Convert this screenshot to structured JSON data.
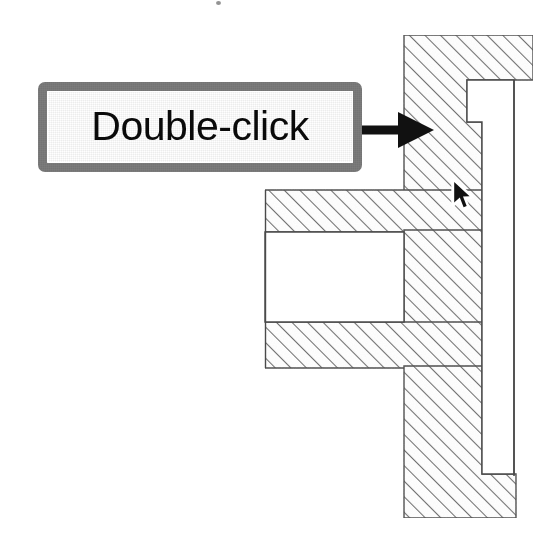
{
  "page": {
    "kind": "instructional-diagram",
    "background_color": "#ffffff",
    "width": 553,
    "height": 556
  },
  "callout": {
    "label": "Double-click",
    "border_color": "#7c7c7c",
    "fill_color": "#ffffff",
    "text_color": "#0a0a0a",
    "x": 38,
    "y": 82,
    "width": 324,
    "height": 90
  },
  "pointer_arrow": {
    "name": "arrow-pointing-right",
    "color": "#111111",
    "from_x": 352,
    "from_y": 130,
    "to_x": 432,
    "to_y": 130
  },
  "cursor": {
    "name": "mouse-pointer",
    "fill_color": "#111111",
    "outline_color": "#ffffff",
    "tip_x": 454,
    "tip_y": 182
  },
  "drawing": {
    "name": "hatched-cross-section-part",
    "outline_color": "#4a4a4a",
    "hatch_color": "#6a6a6a",
    "hatch_angle_degrees": 45,
    "hatch_spacing": 11,
    "fill_color": "#ffffff",
    "regions": [
      {
        "name": "upper-flange-column",
        "points": "404,35 533,35 533,80 467,80 467,122 482,122 482,192 404,192"
      },
      {
        "name": "upper-web-bar",
        "points": "265,190 482,190 482,232 265,232"
      },
      {
        "name": "lower-web-bar",
        "points": "265,322 482,322 482,368 265,368"
      },
      {
        "name": "lower-flange-column",
        "points": "404,192 482,192 482,474 516,474 516,518 404,518"
      },
      {
        "name": "mid-right-column",
        "points": "404,232 482,232 482,322 404,322"
      }
    ],
    "bore_void": {
      "name": "central-bore-void",
      "points": "265,232 404,232 404,322 265,322"
    },
    "notch_void": {
      "name": "right-notch-void",
      "points": "467,80 514,80 514,474 482,474 482,122 467,122"
    }
  },
  "artifact": {
    "name": "scan-speck",
    "x": 216,
    "y": 1
  }
}
